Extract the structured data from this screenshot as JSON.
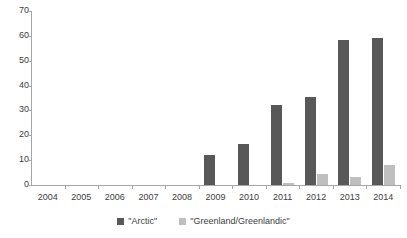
{
  "chart_data": {
    "type": "bar",
    "title": "",
    "subtitle": "",
    "xlabel": "",
    "ylabel": "",
    "categories": [
      "2004",
      "2005",
      "2006",
      "2007",
      "2008",
      "2009",
      "2010",
      "2011",
      "2012",
      "2013",
      "2014"
    ],
    "series": [
      {
        "name": "\"Arctic\"",
        "color": "#585858",
        "values": [
          0,
          0,
          0,
          0,
          0,
          12,
          16.5,
          32,
          35.5,
          58.5,
          59
        ]
      },
      {
        "name": "\"Greenland/Greenlandic\"",
        "color": "#bfbfbf",
        "values": [
          0,
          0,
          0,
          0,
          0,
          0,
          0,
          0.7,
          4.4,
          3.3,
          8.2
        ]
      }
    ],
    "ylim": [
      0,
      70
    ],
    "yticks": [
      0,
      10,
      20,
      30,
      40,
      50,
      60,
      70
    ],
    "ytick_labels": [
      "0",
      "10",
      "20",
      "30",
      "40",
      "50",
      "60",
      "70"
    ],
    "grid": false,
    "legend_position": "bottom",
    "axis_color": "#a6a6a6",
    "text_color": "#404040",
    "background": "#ffffff"
  },
  "legend": {
    "items": [
      {
        "label": "\"Arctic\"",
        "color": "#585858"
      },
      {
        "label": "\"Greenland/Greenlandic\"",
        "color": "#bfbfbf"
      }
    ]
  }
}
